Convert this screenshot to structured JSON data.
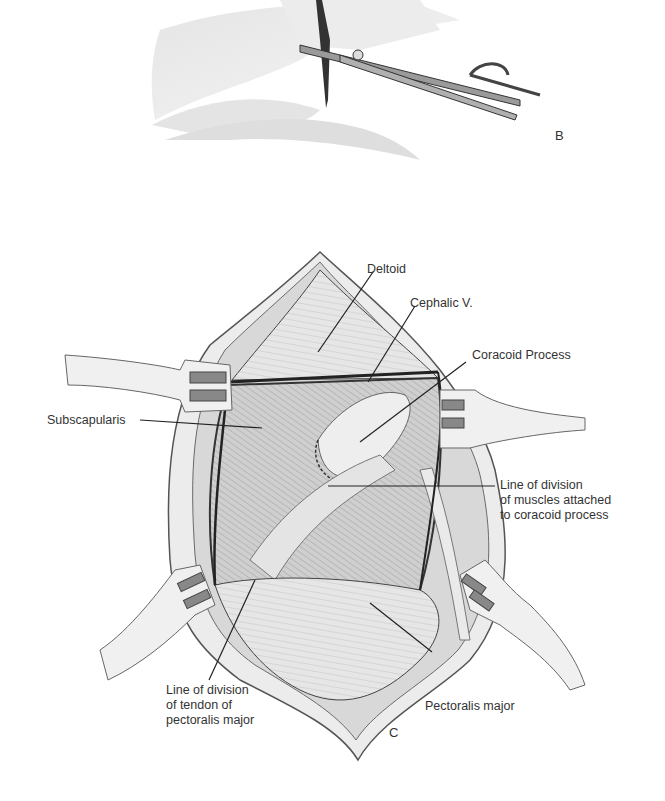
{
  "figure": {
    "panels": [
      {
        "id": "B",
        "letter": "B",
        "description": "Incision with scissors and skin hook"
      },
      {
        "id": "C",
        "letter": "C",
        "description": "Exposure of coracoid process with retractors"
      }
    ],
    "labels": {
      "deltoid": "Deltoid",
      "cephalic_v": "Cephalic V.",
      "coracoid_process": "Coracoid Process",
      "subscapularis": "Subscapularis",
      "line_division_coracoid": "Line of division\nof muscles attached\nto coracoid process",
      "line_division_pectoralis": "Line of division\nof tendon of\npectoralis major",
      "pectoralis_major": "Pectoralis major"
    },
    "colors": {
      "ink": "#2a2a2a",
      "tissue_light": "#e6e6e6",
      "tissue_mid": "#c8c8c8",
      "tissue_dark": "#9a9a9a",
      "background": "#ffffff"
    }
  }
}
